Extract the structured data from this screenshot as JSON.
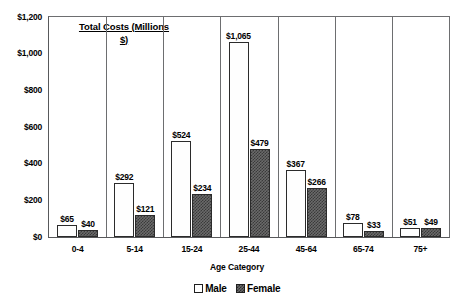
{
  "chart_data": {
    "type": "bar",
    "title": "Total Costs (Millions $)",
    "title_line1": "Total Costs (Millions",
    "title_line2": "$)",
    "xlabel": "Age Category",
    "ylabel": "",
    "ylim": [
      0,
      1200
    ],
    "grid": false,
    "legend_position": "bottom",
    "categories": [
      "0-4",
      "5-14",
      "15-24",
      "25-44",
      "45-64",
      "65-74",
      "75+"
    ],
    "yticks": [
      "$0",
      "$200",
      "$400",
      "$600",
      "$800",
      "$1,000",
      "$1,200"
    ],
    "ytick_values": [
      0,
      200,
      400,
      600,
      800,
      1000,
      1200
    ],
    "series": [
      {
        "name": "Male",
        "values": [
          65,
          292,
          524,
          1065,
          367,
          78,
          51
        ],
        "labels": [
          "$65",
          "$292",
          "$524",
          "$1,065",
          "$367",
          "$78",
          "$51"
        ],
        "fill": "dotted-light",
        "color": "#fefefe"
      },
      {
        "name": "Female",
        "values": [
          40,
          121,
          234,
          479,
          266,
          33,
          49
        ],
        "labels": [
          "$40",
          "$121",
          "$234",
          "$479",
          "$266",
          "$33",
          "$49"
        ],
        "fill": "checkered-dark",
        "color": "#6a6a6a"
      }
    ]
  },
  "legend": {
    "items": [
      {
        "label": "Male",
        "swatch": "male"
      },
      {
        "label": "Female",
        "swatch": "female"
      }
    ]
  }
}
